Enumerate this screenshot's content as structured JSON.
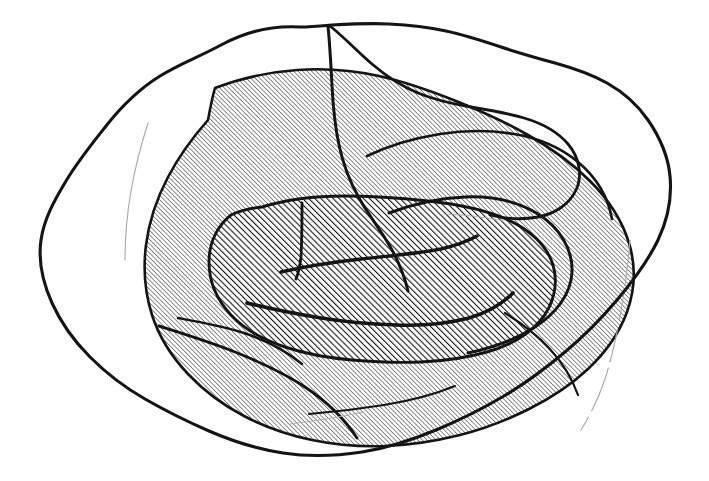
{
  "figure": {
    "domain_kind": "Diagram",
    "canvas": {
      "width": 709,
      "height": 481,
      "background": "#ffffff"
    },
    "ink_color": "#141414",
    "faint_color": "#a8a8a8"
  },
  "palette": {
    "ink": "#141414",
    "faint_line": "#a8a8a8",
    "paper": "#ffffff",
    "outer_hatch": "#2a2a2a",
    "inner_hatch": "#111111"
  },
  "hatching": {
    "outer_region": {
      "name": "fine-hatch",
      "angle_deg": 45,
      "direction": "lower-left to upper-right",
      "line_width_px": 1.05,
      "spacing_px": 3.2,
      "color": "#2a2a2a"
    },
    "inner_region": {
      "name": "coarse-hatch",
      "angle_deg": 45,
      "direction": "lower-left to upper-right",
      "line_width_px": 2.1,
      "spacing_px": 4.3,
      "color": "#111111"
    }
  },
  "regions": [
    {
      "id": "outer-envelope",
      "label": "Outer envelope contour",
      "fill": "none",
      "stroke_width": 3.1,
      "path": "M 300 27 C 268 25 243 33 221 45 C 199 57 181 63 160 76 C 139 89 121 107 106 126 C 91 145 78 161 66 181 C 54 201 44 219 41 240 C 38 261 43 283 52 303 C 61 323 74 341 90 357 C 106 373 124 387 145 399 C 166 411 186 421 209 431 C 232 441 257 449 283 453 C 309 457 336 456 362 452 C 388 448 412 440 436 430 C 460 420 482 409 504 396 C 526 383 546 368 565 352 C 584 336 601 319 617 300 C 633 281 648 261 658 240 C 668 219 672 197 670 176 C 668 155 659 136 648 120 C 637 104 623 92 607 83 C 591 74 573 68 555 63 C 537 58 519 53 501 47 C 483 41 465 35 446 31 C 427 27 408 25 389 24 C 370 23 351 24 332 25 C 321 26 311 27 300 27 Z"
    },
    {
      "id": "outer-hatched-territory",
      "label": "Fine-hatched outer territory",
      "fill": "fine-hatch",
      "stroke_width": 2.6,
      "path": "M 215 88 C 241 78 269 72 297 70 C 325 68 352 70 379 76 C 406 82 431 91 456 101 C 481 111 505 122 528 135 C 551 148 572 163 590 181 C 608 199 622 220 629 243 C 636 266 635 290 627 312 C 619 334 605 353 588 369 C 571 385 551 398 529 409 C 507 420 484 429 460 435 C 436 441 411 445 386 446 C 361 447 336 445 312 440 C 288 435 265 427 244 416 C 223 405 204 391 188 374 C 172 357 159 337 152 315 C 145 293 143 269 146 245 C 149 221 157 198 168 177 C 179 156 193 137 208 120 C 210 109 212 98 215 88 Z"
    },
    {
      "id": "inner-core-territory",
      "label": "Coarse-hatched inner core",
      "fill": "coarse-hatch",
      "stroke_width": 2.9,
      "path": "M 262 207 C 288 199 316 196 344 196 C 372 196 400 198 428 201 C 456 204 483 209 506 219 C 529 229 547 245 553 265 C 559 285 553 306 540 321 C 527 336 508 346 487 352 C 466 358 444 361 421 362 C 398 363 375 362 352 360 C 329 358 306 354 285 347 C 264 340 245 330 231 315 C 217 300 209 281 209 262 C 209 243 217 226 231 215 C 241 210 251 208 262 207 Z"
    }
  ],
  "sulcal_lines": [
    {
      "id": "sulcus-central",
      "label": "Central dividing fissure",
      "stroke_width": 3.0,
      "path": "M 328 26 C 330 46 331 66 332 86 C 333 106 335 126 339 145 C 343 164 350 182 359 198 C 368 214 379 228 388 243 C 397 258 404 274 408 291"
    },
    {
      "id": "sulcus-superior-right",
      "label": "Superior right arching sulcus",
      "stroke_width": 2.7,
      "path": "M 367 156 C 390 145 415 138 440 134 C 465 130 490 130 514 134 C 538 138 560 147 578 162 C 596 177 608 197 612 219"
    },
    {
      "id": "sulcus-lateral-fold",
      "label": "Lateral folding sulcus",
      "stroke_width": 3.0,
      "path": "M 389 213 C 413 204 439 198 465 197 C 491 196 517 201 538 214 C 559 227 573 249 572 272 C 571 295 555 314 535 327 C 515 340 492 348 468 353"
    },
    {
      "id": "sulcus-inferior-long",
      "label": "Inferior long sulcus",
      "stroke_width": 2.9,
      "path": "M 159 326 C 184 334 210 342 235 352 C 260 362 284 373 305 387 C 326 401 344 418 357 438"
    },
    {
      "id": "sulcus-inferior-branch",
      "label": "Inferior branching sulcus",
      "stroke_width": 2.5,
      "path": "M 178 318 C 200 322 223 326 244 333 C 265 340 285 350 302 364"
    },
    {
      "id": "sulcus-core-upper",
      "label": "Core upper tapered sulcus",
      "stroke_width": 3.4,
      "path": "M 281 272 C 307 266 334 262 361 259 C 388 256 415 254 441 249 C 454 246 466 242 477 236"
    },
    {
      "id": "sulcus-core-lower",
      "label": "Core lower tapered sulcus",
      "stroke_width": 3.6,
      "path": "M 247 303 C 271 309 296 314 321 318 C 346 322 371 324 396 325 C 421 326 446 324 469 318 C 486 313 501 305 513 293"
    },
    {
      "id": "sulcus-core-vertical",
      "label": "Core vertical partition",
      "stroke_width": 2.8,
      "path": "M 302 203 C 302 221 302 239 301 257 C 300 265 299 272 296 279"
    },
    {
      "id": "sulcus-lower-inner-arc",
      "label": "Lower inner arc",
      "stroke_width": 2.0,
      "path": "M 309 414 C 334 412 359 409 384 405 C 409 401 433 395 455 386"
    },
    {
      "id": "sulcus-right-inner-arc",
      "label": "Right inner arc",
      "stroke_width": 2.2,
      "path": "M 505 313 C 521 323 536 334 549 348 C 562 362 572 378 578 395"
    }
  ],
  "faint_lines": [
    {
      "id": "faint-left-margin",
      "label": "Faint left marginal line",
      "stroke_width": 1.1,
      "path": "M 148 123 C 141 145 135 168 131 191 C 127 214 125 237 125 260"
    },
    {
      "id": "faint-right-margin",
      "label": "Faint right marginal line (broken)",
      "stroke_width": 1.1,
      "dash": "46 7 28 9 34 6",
      "path": "M 630 240 C 628 264 625 288 621 311 C 617 334 612 357 605 379 C 599 397 591 414 581 430"
    },
    {
      "id": "faint-core-top",
      "label": "Faint core top highlight",
      "stroke_width": 0.9,
      "path": "M 446 214 C 466 215 485 217 503 221"
    },
    {
      "id": "faint-lower-sliver",
      "label": "Faint lower sliver",
      "stroke_width": 0.9,
      "path": "M 290 424 C 315 421 340 417 364 412"
    }
  ],
  "notch_detail": {
    "id": "top-right-lobe",
    "label": "Top-right tucked lobe contour",
    "stroke_width": 2.8,
    "path": "M 330 26 C 345 38 358 52 372 64 C 386 76 401 86 418 93 C 435 100 453 104 471 107 C 489 110 507 113 524 118 C 541 123 557 131 568 144 C 579 157 583 175 576 190 C 569 205 554 214 538 217 C 522 220 506 219 490 215"
  }
}
